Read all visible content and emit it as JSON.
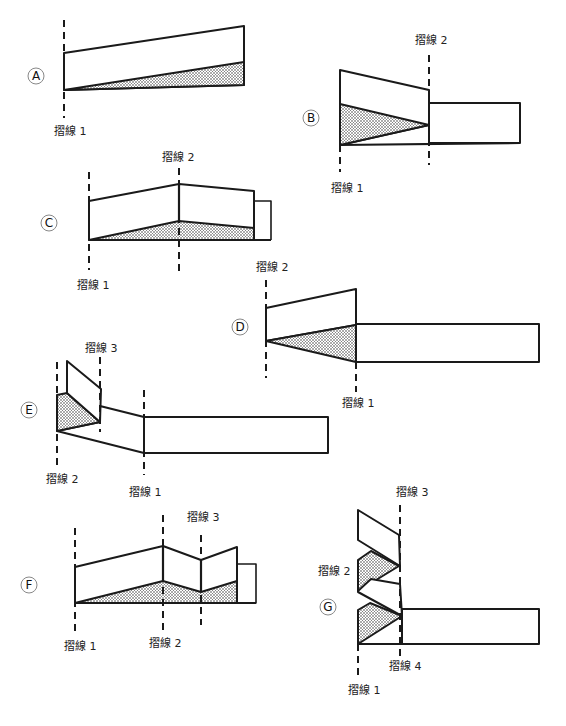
{
  "diagram": {
    "fold_label_prefix": "摺線",
    "colors": {
      "line": "#1a1a1a",
      "shade_dots": "#333333",
      "background": "#ffffff"
    },
    "steps": [
      {
        "id": "A",
        "letter": "A",
        "labels": [
          {
            "text": "摺線 1"
          }
        ]
      },
      {
        "id": "B",
        "letter": "B",
        "labels": [
          {
            "text": "摺線 2"
          },
          {
            "text": "摺線 1"
          }
        ]
      },
      {
        "id": "C",
        "letter": "C",
        "labels": [
          {
            "text": "摺線 2"
          },
          {
            "text": "摺線 1"
          }
        ]
      },
      {
        "id": "D",
        "letter": "D",
        "labels": [
          {
            "text": "摺線 2"
          },
          {
            "text": "摺線 1"
          }
        ]
      },
      {
        "id": "E",
        "letter": "E",
        "labels": [
          {
            "text": "摺線 3"
          },
          {
            "text": "摺線 2"
          },
          {
            "text": "摺線 1"
          }
        ]
      },
      {
        "id": "F",
        "letter": "F",
        "labels": [
          {
            "text": "摺線 3"
          },
          {
            "text": "摺線 1"
          },
          {
            "text": "摺線 2"
          }
        ]
      },
      {
        "id": "G",
        "letter": "G",
        "labels": [
          {
            "text": "摺線 3"
          },
          {
            "text": "摺線 2"
          },
          {
            "text": "摺線 4"
          },
          {
            "text": "摺線 1"
          }
        ]
      }
    ]
  }
}
